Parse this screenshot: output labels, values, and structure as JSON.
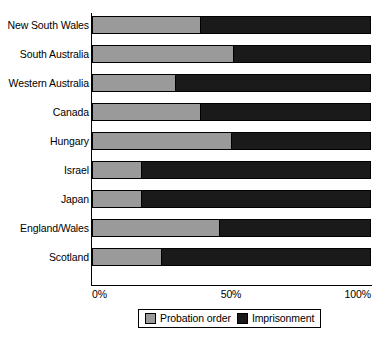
{
  "chart_data": {
    "type": "bar",
    "orientation": "horizontal",
    "stacked": true,
    "normalized": true,
    "title": "",
    "subtitle": "",
    "xlabel": "",
    "ylabel": "",
    "xlim": [
      0,
      100
    ],
    "grid": false,
    "legend_position": "bottom",
    "categories": [
      "New South Wales",
      "South Australia",
      "Western Australia",
      "Canada",
      "Hungary",
      "Israel",
      "Japan",
      "England/Wales",
      "Scotland"
    ],
    "xtick_labels": [
      "0%",
      "50%",
      "100%"
    ],
    "xtick_values": [
      0,
      50,
      100
    ],
    "series": [
      {
        "name": "Probation order",
        "color": "#9a9a9a",
        "values": [
          39,
          51,
          30,
          39,
          50,
          18,
          18,
          46,
          25
        ]
      },
      {
        "name": "Imprisonment",
        "color": "#1a1a1a",
        "values": [
          61,
          49,
          70,
          61,
          50,
          82,
          82,
          54,
          75
        ]
      }
    ],
    "legend": [
      {
        "label": "Probation order",
        "swatch": "#9a9a9a"
      },
      {
        "label": "Imprisonment",
        "swatch": "#1a1a1a"
      }
    ]
  },
  "axis": {
    "tick_0": "0%",
    "tick_50": "50%",
    "tick_100": "100%"
  }
}
